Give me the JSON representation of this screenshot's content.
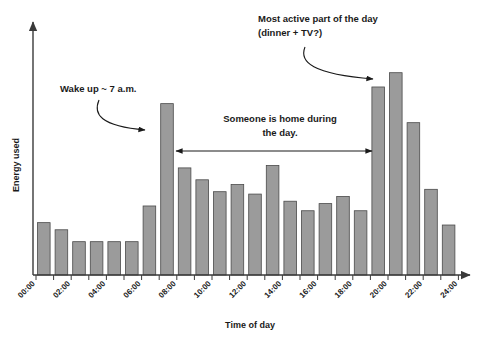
{
  "chart_data": {
    "type": "bar",
    "title": "",
    "xlabel": "Time of day",
    "ylabel": "Energy used",
    "grid": false,
    "legend": "none",
    "xlim": [
      0,
      24
    ],
    "ylim": [
      0,
      100
    ],
    "categories": [
      "00:00",
      "01:00",
      "02:00",
      "03:00",
      "04:00",
      "05:00",
      "06:00",
      "07:00",
      "08:00",
      "09:00",
      "10:00",
      "11:00",
      "12:00",
      "13:00",
      "14:00",
      "15:00",
      "16:00",
      "17:00",
      "18:00",
      "19:00",
      "20:00",
      "21:00",
      "22:00",
      "23:00"
    ],
    "values": [
      22,
      19,
      14,
      14,
      14,
      14,
      29,
      72,
      45,
      40,
      35,
      38,
      34,
      46,
      31,
      27,
      30,
      33,
      27,
      79,
      85,
      64,
      36,
      21
    ],
    "tick_labels": [
      "00:00",
      "02:00",
      "04:00",
      "06:00",
      "08:00",
      "10:00",
      "12:00",
      "14:00",
      "16:00",
      "18:00",
      "20:00",
      "22:00",
      "24:00"
    ],
    "bar_color": "#9b9b9b",
    "bar_edge_color": "#4a4a4a",
    "axis_color": "#3a3a3a",
    "annotations": [
      {
        "id": "wake-up",
        "text": "Wake up ~ 7 a.m.",
        "kind": "curved-arrow",
        "points_to": "07:00"
      },
      {
        "id": "most-active",
        "line1": "Most active part of the day",
        "line2": "(dinner + TV?)",
        "kind": "curved-arrow",
        "points_to": "19:00"
      },
      {
        "id": "someone-home",
        "line1": "Someone is home during",
        "line2": "the day.",
        "kind": "double-headed-arrow",
        "span_from": "08:00",
        "span_to": "19:00"
      }
    ]
  }
}
